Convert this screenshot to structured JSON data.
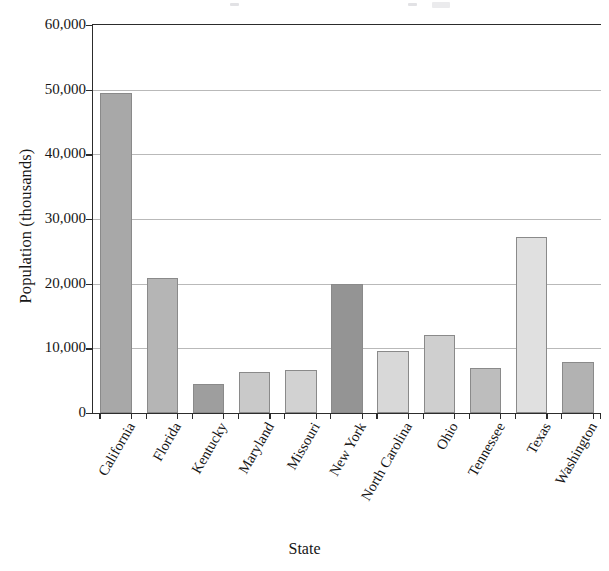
{
  "chart_data": {
    "type": "bar",
    "title": "",
    "xlabel": "State",
    "ylabel": "Population (thousands)",
    "categories": [
      "California",
      "Florida",
      "Kentucky",
      "Maryland",
      "Missouri",
      "New York",
      "North Carolina",
      "Ohio",
      "Tennessee",
      "Texas",
      "Washington"
    ],
    "values": [
      49500,
      20900,
      4500,
      6400,
      6700,
      20000,
      9600,
      12000,
      7000,
      27200,
      7900
    ],
    "bar_colors": [
      "#a8a8a8",
      "#b5b5b5",
      "#9e9e9e",
      "#c9c9c9",
      "#d2d2d2",
      "#949494",
      "#d8d8d8",
      "#cfcfcf",
      "#bdbdbd",
      "#e0e0e0",
      "#b2b2b2"
    ],
    "ylim": [
      0,
      60000
    ],
    "ytick_values": [
      0,
      10000,
      20000,
      30000,
      40000,
      50000,
      60000
    ],
    "ytick_labels": [
      "0",
      "10,000",
      "20,000",
      "30,000",
      "40,000",
      "50,000",
      "60,000"
    ],
    "grid": true,
    "legend": "none",
    "axis_color": "#2c2c2c",
    "gridline_color": "#b9b9b9"
  }
}
